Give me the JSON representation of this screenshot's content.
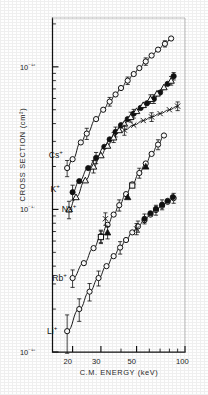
{
  "figure": {
    "background_color": "#fefefe",
    "ink_color": "#111111"
  },
  "chart_data": {
    "type": "scatter",
    "title": "",
    "xlabel": "C.M. ENERGY  (keV)",
    "ylabel": "CROSS SECTION  (cm²)",
    "xscale": "log",
    "yscale": "log",
    "xlim": [
      15,
      100
    ],
    "ylim": [
      1e-18,
      2.2e-16
    ],
    "grid": false,
    "legend_position": "inline-annotations",
    "xtick_labels": [
      "20",
      "30",
      "50",
      "100"
    ],
    "xtick_values": [
      20,
      30,
      50,
      100
    ],
    "ytick_labels": [
      "10⁻¹⁶",
      "10⁻¹⁷",
      "10⁻¹⁸"
    ],
    "ytick_values": [
      1e-16,
      1e-17,
      1e-18
    ],
    "annotations": [
      {
        "text": "Cs",
        "sup": "+",
        "x": 19.5,
        "y": 2.45e-17
      },
      {
        "text": "K",
        "sup": "+",
        "x": 20.0,
        "y": 1.42e-17
      },
      {
        "text": "Na",
        "sup": "+",
        "x": 23.5,
        "y": 1.02e-17
      },
      {
        "text": "Rb",
        "sup": "+",
        "x": 20.5,
        "y": 3.35e-18
      },
      {
        "text": "Li",
        "sup": "+",
        "x": 19.0,
        "y": 1.42e-18
      }
    ],
    "series": [
      {
        "name": "Cs+",
        "marker": "open-circle",
        "line": true,
        "points": [
          {
            "x": 18.5,
            "y": 1.95e-17,
            "err": 0.13
          },
          {
            "x": 20.0,
            "y": 2.25e-17,
            "err": 0.11
          },
          {
            "x": 22.5,
            "y": 2.95e-17,
            "err": 0.1
          },
          {
            "x": 24.5,
            "y": 3.4e-17,
            "err": 0.09
          },
          {
            "x": 28.0,
            "y": 4.3e-17,
            "err": 0.08
          },
          {
            "x": 31.0,
            "y": 5e-17,
            "err": 0.08
          },
          {
            "x": 34.0,
            "y": 5.7e-17,
            "err": 0.07
          },
          {
            "x": 37.0,
            "y": 6.4e-17,
            "err": 0.07
          },
          {
            "x": 40.0,
            "y": 7.1e-17,
            "err": 0.07
          },
          {
            "x": 44.0,
            "y": 8e-17,
            "err": 0.06
          },
          {
            "x": 48.0,
            "y": 8.9e-17,
            "err": 0.06
          },
          {
            "x": 52.0,
            "y": 9.8e-17,
            "err": 0.06
          },
          {
            "x": 57.0,
            "y": 1.09e-16,
            "err": 0.06
          },
          {
            "x": 62.0,
            "y": 1.2e-16,
            "err": 0.06
          },
          {
            "x": 68.0,
            "y": 1.32e-16,
            "err": 0.05
          },
          {
            "x": 75.0,
            "y": 1.45e-16,
            "err": 0.05
          },
          {
            "x": 82.0,
            "y": 1.58e-16,
            "err": 0.05
          }
        ]
      },
      {
        "name": "K+",
        "marker": "filled-circle",
        "line": true,
        "points": [
          {
            "x": 20.0,
            "y": 1.32e-17,
            "err": 0.12
          },
          {
            "x": 22.0,
            "y": 1.58e-17,
            "err": 0.11
          },
          {
            "x": 25.0,
            "y": 1.95e-17,
            "err": 0.1
          },
          {
            "x": 28.0,
            "y": 2.3e-17,
            "err": 0.09
          },
          {
            "x": 31.5,
            "y": 2.75e-17,
            "err": 0.08
          },
          {
            "x": 34.0,
            "y": 3.1e-17,
            "err": 0.08
          },
          {
            "x": 37.0,
            "y": 3.5e-17,
            "err": 0.08
          },
          {
            "x": 40.0,
            "y": 3.9e-17,
            "err": 0.07
          },
          {
            "x": 44.0,
            "y": 4.3e-17,
            "err": 0.07
          },
          {
            "x": 48.0,
            "y": 4.7e-17,
            "err": 0.07
          },
          {
            "x": 53.0,
            "y": 5.15e-17,
            "err": 0.07
          },
          {
            "x": 58.0,
            "y": 5.55e-17,
            "err": 0.07
          },
          {
            "x": 64.0,
            "y": 5.95e-17,
            "err": 0.07
          },
          {
            "x": 70.0,
            "y": 6.6e-17,
            "err": 0.06
          },
          {
            "x": 78.0,
            "y": 7.6e-17,
            "err": 0.06
          },
          {
            "x": 85.0,
            "y": 8.6e-17,
            "err": 0.06
          }
        ]
      },
      {
        "name": "Na+",
        "marker": "open-triangle",
        "line": true,
        "points": [
          {
            "x": 19.0,
            "y": 1e-17,
            "err": 0.14
          },
          {
            "x": 21.0,
            "y": 1.22e-17,
            "err": 0.12
          },
          {
            "x": 24.0,
            "y": 1.6e-17,
            "err": 0.11
          },
          {
            "x": 27.0,
            "y": 2e-17,
            "err": 0.1
          },
          {
            "x": 30.0,
            "y": 2.4e-17,
            "err": 0.09
          },
          {
            "x": 33.0,
            "y": 2.8e-17,
            "err": 0.09
          },
          {
            "x": 36.0,
            "y": 3.2e-17,
            "err": 0.08
          },
          {
            "x": 39.0,
            "y": 3.6e-17,
            "err": 0.08
          },
          {
            "x": 42.0,
            "y": 4e-17,
            "err": 0.08
          },
          {
            "x": 46.0,
            "y": 4.45e-17,
            "err": 0.08
          },
          {
            "x": 50.0,
            "y": 4.9e-17,
            "err": 0.07
          },
          {
            "x": 55.0,
            "y": 5.4e-17,
            "err": 0.07
          },
          {
            "x": 61.0,
            "y": 5.95e-17,
            "err": 0.07
          },
          {
            "x": 67.0,
            "y": 6.5e-17,
            "err": 0.07
          },
          {
            "x": 74.0,
            "y": 7.2e-17,
            "err": 0.07
          },
          {
            "x": 82.0,
            "y": 8e-17,
            "err": 0.07
          }
        ]
      },
      {
        "name": "flat-branch",
        "marker": "cross",
        "line": true,
        "points": [
          {
            "x": 42.0,
            "y": 3.6e-17,
            "err": 0.08
          },
          {
            "x": 48.0,
            "y": 3.9e-17,
            "err": 0.07
          },
          {
            "x": 55.0,
            "y": 4.2e-17,
            "err": 0.07
          },
          {
            "x": 62.0,
            "y": 4.45e-17,
            "err": 0.07
          },
          {
            "x": 70.0,
            "y": 4.7e-17,
            "err": 0.07
          },
          {
            "x": 80.0,
            "y": 5e-17,
            "err": 0.07
          },
          {
            "x": 90.0,
            "y": 5.3e-17,
            "err": 0.07
          }
        ]
      },
      {
        "name": "Rb+",
        "marker": "open-circle",
        "line": true,
        "points": [
          {
            "x": 20.0,
            "y": 3.3e-18,
            "err": 0.14
          },
          {
            "x": 23.5,
            "y": 4.2e-18,
            "err": 0.12
          },
          {
            "x": 27.0,
            "y": 5.35e-18,
            "err": 0.11
          },
          {
            "x": 30.0,
            "y": 6.5e-18,
            "err": 0.1
          },
          {
            "x": 33.0,
            "y": 7.8e-18,
            "err": 0.1
          },
          {
            "x": 36.0,
            "y": 9.2e-18,
            "err": 0.09
          },
          {
            "x": 39.0,
            "y": 1.07e-17,
            "err": 0.09
          },
          {
            "x": 43.0,
            "y": 1.28e-17,
            "err": 0.09
          },
          {
            "x": 47.0,
            "y": 1.5e-17,
            "err": 0.09
          },
          {
            "x": 52.0,
            "y": 1.8e-17,
            "err": 0.08
          },
          {
            "x": 57.0,
            "y": 2.1e-17,
            "err": 0.08
          },
          {
            "x": 62.0,
            "y": 2.45e-17,
            "err": 0.08
          },
          {
            "x": 68.0,
            "y": 2.85e-17,
            "err": 0.08
          },
          {
            "x": 74.0,
            "y": 3.3e-17,
            "err": 0.09
          }
        ]
      },
      {
        "name": "Li+",
        "marker": "open-circle",
        "line": true,
        "points": [
          {
            "x": 18.5,
            "y": 1.4e-18,
            "err": 0.3
          },
          {
            "x": 22.0,
            "y": 2e-18,
            "err": 0.18
          },
          {
            "x": 25.5,
            "y": 2.65e-18,
            "err": 0.14
          },
          {
            "x": 29.0,
            "y": 3.3e-18,
            "err": 0.12
          },
          {
            "x": 32.5,
            "y": 4e-18,
            "err": 0.11
          },
          {
            "x": 36.0,
            "y": 4.7e-18,
            "err": 0.1
          },
          {
            "x": 39.5,
            "y": 5.4e-18,
            "err": 0.1
          },
          {
            "x": 43.0,
            "y": 6.1e-18,
            "err": 0.09
          },
          {
            "x": 47.0,
            "y": 6.9e-18,
            "err": 0.09
          },
          {
            "x": 51.0,
            "y": 7.6e-18,
            "err": 0.09
          },
          {
            "x": 56.0,
            "y": 8.4e-18,
            "err": 0.09
          },
          {
            "x": 61.0,
            "y": 9.2e-18,
            "err": 0.08
          },
          {
            "x": 66.0,
            "y": 9.9e-18,
            "err": 0.08
          },
          {
            "x": 72.0,
            "y": 1.06e-17,
            "err": 0.08
          },
          {
            "x": 78.0,
            "y": 1.13e-17,
            "err": 0.08
          },
          {
            "x": 85.0,
            "y": 1.2e-17,
            "err": 0.08
          }
        ]
      },
      {
        "name": "Li+-filled-overlay",
        "marker": "filled-circle",
        "line": false,
        "points": [
          {
            "x": 56.0,
            "y": 8.6e-18,
            "err": 0.08
          },
          {
            "x": 61.0,
            "y": 9.4e-18,
            "err": 0.08
          },
          {
            "x": 66.0,
            "y": 1.01e-17,
            "err": 0.08
          },
          {
            "x": 72.0,
            "y": 1.08e-17,
            "err": 0.08
          },
          {
            "x": 78.0,
            "y": 1.15e-17,
            "err": 0.08
          },
          {
            "x": 84.0,
            "y": 1.22e-17,
            "err": 0.08
          }
        ]
      },
      {
        "name": "Rb+-square-overlay",
        "marker": "open-square",
        "line": false,
        "points": [
          {
            "x": 30.0,
            "y": 6.4e-18,
            "err": 0.1
          },
          {
            "x": 47.0,
            "y": 1.47e-17,
            "err": 0.09
          }
        ]
      },
      {
        "name": "Rb+-triangle-overlay",
        "marker": "filled-triangle",
        "line": false,
        "points": [
          {
            "x": 33.0,
            "y": 6.9e-18,
            "err": 0.1
          },
          {
            "x": 44.0,
            "y": 1.22e-17,
            "err": 0.09
          },
          {
            "x": 57.0,
            "y": 2e-17,
            "err": 0.08
          }
        ]
      },
      {
        "name": "Rb+-cross-overlay",
        "marker": "cross",
        "line": false,
        "points": [
          {
            "x": 32.0,
            "y": 8.6e-18,
            "err": 0.1
          }
        ]
      },
      {
        "name": "Li+-cross-overlay",
        "marker": "cross",
        "line": false,
        "points": [
          {
            "x": 50.0,
            "y": 7.3e-18,
            "err": 0.09
          }
        ]
      }
    ]
  }
}
